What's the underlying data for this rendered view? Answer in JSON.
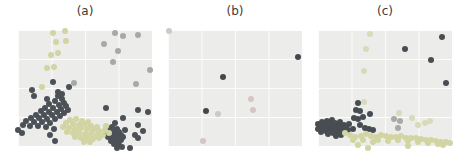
{
  "figure": {
    "background_color": "#ffffff",
    "panel_background_color": "#ecedea",
    "grid_color": "#f8f8f6",
    "label_color": "#3b3b3b",
    "palette": {
      "dark_slate": "#4b5157",
      "gray": "#a6a9a4",
      "khaki": "#d2d4a2",
      "light_khaki": "#d9dab9",
      "pink": "#d8c3c5",
      "light_gray_green": "#c9cdc4"
    }
  },
  "chart_data": [
    {
      "type": "scatter",
      "title": "(a)",
      "xlabel": "",
      "ylabel": "",
      "axes_visible": false,
      "tick_labels": false,
      "grid": true,
      "panel_px": [
        134,
        116
      ],
      "coord_note": "points are pixel offsets [x,y] from panel top-left",
      "series": [
        {
          "name": "dark-slate-points",
          "color": "#4b5157",
          "points": [
            [
              14,
              60
            ],
            [
              35,
              52
            ],
            [
              51,
              57
            ],
            [
              16,
              66
            ],
            [
              29,
              69
            ],
            [
              40,
              62
            ],
            [
              44,
              64
            ],
            [
              40,
              66
            ],
            [
              44,
              69
            ],
            [
              37,
              71
            ],
            [
              46,
              73
            ],
            [
              31,
              74
            ],
            [
              41,
              75
            ],
            [
              48,
              76
            ],
            [
              27,
              78
            ],
            [
              35,
              78
            ],
            [
              43,
              79
            ],
            [
              50,
              80
            ],
            [
              23,
              81
            ],
            [
              31,
              82
            ],
            [
              39,
              82
            ],
            [
              46,
              83
            ],
            [
              18,
              85
            ],
            [
              26,
              85
            ],
            [
              34,
              85
            ],
            [
              42,
              86
            ],
            [
              13,
              88
            ],
            [
              21,
              88
            ],
            [
              29,
              89
            ],
            [
              37,
              89
            ],
            [
              8,
              91
            ],
            [
              16,
              92
            ],
            [
              24,
              92
            ],
            [
              32,
              93
            ],
            [
              5,
              95
            ],
            [
              12,
              96
            ],
            [
              20,
              96
            ],
            [
              28,
              97
            ],
            [
              0,
              100
            ],
            [
              4,
              103
            ],
            [
              36,
              99
            ],
            [
              32,
              105
            ],
            [
              37,
              111
            ],
            [
              88,
              78
            ],
            [
              120,
              80
            ],
            [
              130,
              82
            ],
            [
              105,
              88
            ],
            [
              97,
              93
            ],
            [
              94,
              97
            ],
            [
              99,
              99
            ],
            [
              120,
              95
            ],
            [
              91,
              100
            ],
            [
              96,
              102
            ],
            [
              101,
              102
            ],
            [
              107,
              100
            ],
            [
              88,
              104
            ],
            [
              93,
              105
            ],
            [
              98,
              105
            ],
            [
              103,
              105
            ],
            [
              125,
              101
            ],
            [
              90,
              107
            ],
            [
              95,
              108
            ],
            [
              100,
              108
            ],
            [
              105,
              107
            ],
            [
              117,
              105
            ],
            [
              93,
              111
            ],
            [
              98,
              111
            ],
            [
              103,
              110
            ],
            [
              120,
              108
            ],
            [
              96,
              114
            ],
            [
              101,
              115
            ],
            [
              100,
              113
            ],
            [
              112,
              118
            ],
            [
              99,
              118
            ],
            [
              104,
              117
            ]
          ]
        },
        {
          "name": "gray-points",
          "color": "#a6a9a4",
          "points": [
            [
              97,
              3
            ],
            [
              105,
              6
            ],
            [
              120,
              5
            ],
            [
              86,
              14
            ],
            [
              100,
              21
            ],
            [
              95,
              32
            ],
            [
              132,
              40
            ],
            [
              118,
              54
            ],
            [
              56,
              53
            ]
          ]
        },
        {
          "name": "khaki-points",
          "color": "#d2d4a2",
          "points": [
            [
              35,
              3
            ],
            [
              47,
              1
            ],
            [
              38,
              12
            ],
            [
              48,
              11
            ],
            [
              33,
              25
            ],
            [
              40,
              23
            ],
            [
              29,
              38
            ],
            [
              36,
              37
            ],
            [
              24,
              57
            ],
            [
              52,
              90
            ],
            [
              58,
              89
            ],
            [
              64,
              91
            ],
            [
              70,
              92
            ],
            [
              48,
              93
            ],
            [
              55,
              94
            ],
            [
              61,
              95
            ],
            [
              67,
              94
            ],
            [
              73,
              96
            ],
            [
              79,
              97
            ],
            [
              45,
              97
            ],
            [
              51,
              98
            ],
            [
              57,
              99
            ],
            [
              63,
              98
            ],
            [
              69,
              99
            ],
            [
              75,
              100
            ],
            [
              81,
              101
            ],
            [
              87,
              100
            ],
            [
              49,
              102
            ],
            [
              55,
              103
            ],
            [
              61,
              103
            ],
            [
              67,
              104
            ],
            [
              73,
              104
            ],
            [
              79,
              105
            ],
            [
              85,
              105
            ],
            [
              91,
              103
            ],
            [
              57,
              107
            ],
            [
              63,
              108
            ],
            [
              69,
              108
            ],
            [
              75,
              109
            ],
            [
              81,
              108
            ],
            [
              66,
              112
            ],
            [
              72,
              112
            ],
            [
              88,
              96
            ]
          ]
        }
      ]
    },
    {
      "type": "scatter",
      "title": "(b)",
      "xlabel": "",
      "ylabel": "",
      "axes_visible": false,
      "tick_labels": false,
      "grid": true,
      "panel_px": [
        134,
        116
      ],
      "coord_note": "points are pixel offsets [x,y] from panel top-left",
      "series": [
        {
          "name": "dark-slate-points",
          "color": "#42484e",
          "points": [
            [
              130,
              27
            ],
            [
              55,
              47
            ],
            [
              38,
              81
            ]
          ]
        },
        {
          "name": "pink-points",
          "color": "#d8c3c5",
          "points": [
            [
              83,
              69
            ],
            [
              85,
              80
            ],
            [
              35,
              111
            ]
          ]
        },
        {
          "name": "light-gray-green-points",
          "color": "#c9cdc4",
          "points": [
            [
              1,
              1
            ],
            [
              50,
              84
            ]
          ]
        }
      ]
    },
    {
      "type": "scatter",
      "title": "(c)",
      "xlabel": "",
      "ylabel": "",
      "axes_visible": false,
      "tick_labels": false,
      "grid": true,
      "panel_px": [
        134,
        116
      ],
      "coord_note": "points are pixel offsets [x,y] from panel top-left",
      "series": [
        {
          "name": "dark-slate-points",
          "color": "#474d53",
          "points": [
            [
              124,
              7
            ],
            [
              87,
              19
            ],
            [
              113,
              30
            ],
            [
              128,
              53
            ],
            [
              40,
              73
            ],
            [
              38,
              80
            ],
            [
              42,
              81
            ],
            [
              36,
              88
            ],
            [
              40,
              89
            ],
            [
              45,
              87
            ],
            [
              52,
              84
            ],
            [
              4,
              92
            ],
            [
              9,
              91
            ],
            [
              14,
              90
            ],
            [
              2,
              96
            ],
            [
              7,
              95
            ],
            [
              12,
              94
            ],
            [
              17,
              93
            ],
            [
              22,
              92
            ],
            [
              6,
              99
            ],
            [
              11,
              98
            ],
            [
              16,
              97
            ],
            [
              21,
              96
            ],
            [
              26,
              95
            ],
            [
              31,
              94
            ],
            [
              3,
              102
            ],
            [
              8,
              101
            ],
            [
              13,
              100
            ],
            [
              18,
              99
            ],
            [
              23,
              98
            ],
            [
              28,
              97
            ],
            [
              10,
              104
            ],
            [
              15,
              103
            ],
            [
              20,
              102
            ],
            [
              25,
              101
            ],
            [
              30,
              100
            ],
            [
              35,
              99
            ],
            [
              18,
              106
            ],
            [
              23,
              105
            ],
            [
              0,
              94
            ],
            [
              0,
              99
            ],
            [
              47,
              98
            ],
            [
              51,
              99
            ],
            [
              55,
              100
            ],
            [
              42,
              95
            ]
          ]
        },
        {
          "name": "light-khaki-points",
          "color": "#d9dab9",
          "points": [
            [
              52,
              4
            ],
            [
              48,
              19
            ],
            [
              46,
              41
            ],
            [
              94,
              88
            ],
            [
              100,
              95
            ],
            [
              107,
              93
            ],
            [
              112,
              91
            ],
            [
              81,
              83
            ],
            [
              46,
              72
            ]
          ]
        },
        {
          "name": "gray-points",
          "color": "#a6a9a4",
          "points": [
            [
              76,
              89
            ],
            [
              82,
              91
            ],
            [
              80,
              98
            ]
          ]
        },
        {
          "name": "khaki-points",
          "color": "#d2d4a2",
          "points": [
            [
              27,
              103
            ],
            [
              32,
              105
            ],
            [
              37,
              107
            ],
            [
              43,
              106
            ],
            [
              48,
              104
            ],
            [
              53,
              106
            ],
            [
              58,
              107
            ],
            [
              63,
              105
            ],
            [
              68,
              106
            ],
            [
              73,
              107
            ],
            [
              78,
              107
            ],
            [
              83,
              106
            ],
            [
              88,
              108
            ],
            [
              93,
              108
            ],
            [
              98,
              108
            ],
            [
              103,
              109
            ],
            [
              108,
              110
            ],
            [
              113,
              110
            ],
            [
              118,
              111
            ],
            [
              123,
              112
            ],
            [
              128,
              112
            ],
            [
              132,
              113
            ],
            [
              60,
              110
            ],
            [
              70,
              111
            ],
            [
              80,
              110
            ],
            [
              90,
              111
            ],
            [
              100,
              112
            ],
            [
              110,
              113
            ],
            [
              120,
              114
            ],
            [
              55,
              112
            ],
            [
              45,
              110
            ],
            [
              35,
              110
            ],
            [
              40,
              115
            ],
            [
              50,
              118
            ],
            [
              90,
              116
            ],
            [
              125,
              115
            ]
          ]
        }
      ]
    }
  ]
}
